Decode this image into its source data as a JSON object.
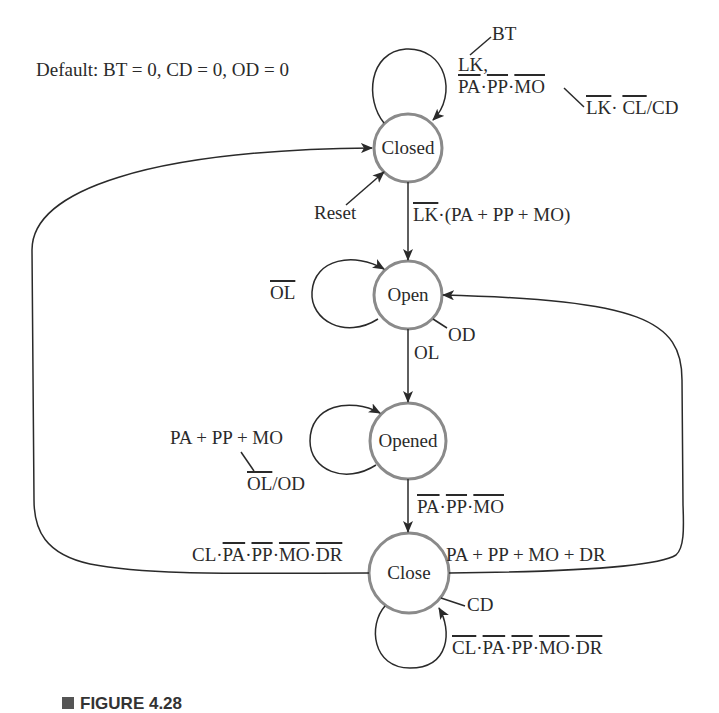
{
  "diagram": {
    "type": "state-machine",
    "default_note": "Default: BT = 0, CD = 0, OD = 0",
    "states": [
      {
        "id": "closed",
        "label": "Closed"
      },
      {
        "id": "open",
        "label": "Open"
      },
      {
        "id": "opened",
        "label": "Opened"
      },
      {
        "id": "close",
        "label": "Close"
      }
    ],
    "reset_label": "Reset",
    "transitions": {
      "closed_self": {
        "line1": "LK,",
        "line2_terms": [
          "PA",
          "PP",
          "MO"
        ],
        "output_bt": "BT",
        "output2_terms": [
          "LK",
          "CL"
        ],
        "output2_suffix": "/CD"
      },
      "closed_to_open": {
        "neg": "LK",
        "rest": "·(PA + PP + MO)"
      },
      "open_self": {
        "neg": "OL"
      },
      "open_output": "OD",
      "open_to_opened": "OL",
      "opened_self": {
        "cond": "PA + PP + MO",
        "neg": "OL",
        "suffix": "/OD"
      },
      "opened_to_close": {
        "terms": [
          "PA",
          "PP",
          "MO"
        ]
      },
      "close_to_closed": {
        "prefix": "CL",
        "terms": [
          "PA",
          "PP",
          "MO",
          "DR"
        ]
      },
      "close_to_open": "PA + PP + MO + DR",
      "close_output": "CD",
      "close_self": {
        "terms": [
          "CL",
          "PA",
          "PP",
          "MO",
          "DR"
        ]
      }
    },
    "caption": "FIGURE 4.28"
  }
}
